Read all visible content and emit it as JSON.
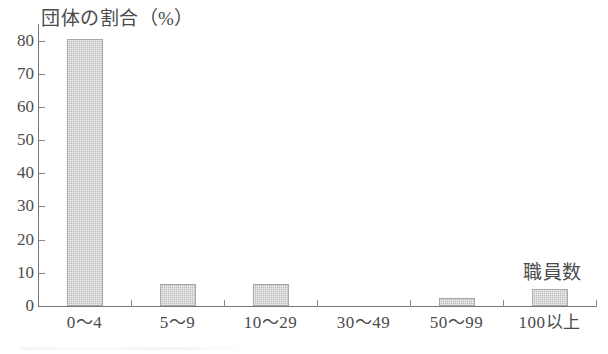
{
  "chart_data": {
    "type": "bar",
    "title": "団体の割合（%）",
    "xlabel": "職員数",
    "ylabel": "団体の割合（%）",
    "categories": [
      "0〜4",
      "5〜9",
      "10〜29",
      "30〜49",
      "50〜99",
      "100以上"
    ],
    "values": [
      80.5,
      6.5,
      6.5,
      0,
      2.5,
      5
    ],
    "ylim": [
      0,
      85
    ],
    "ytick_labels": [
      "0",
      "10",
      "20",
      "30",
      "40",
      "50",
      "60",
      "70",
      "80"
    ],
    "ytick_values": [
      0,
      10,
      20,
      30,
      40,
      50,
      60,
      70,
      80
    ],
    "grid": false,
    "legend": "none",
    "bar_color": "#bdbdbd",
    "axis_color": "#777777",
    "text_color": "#4a4a4a"
  }
}
